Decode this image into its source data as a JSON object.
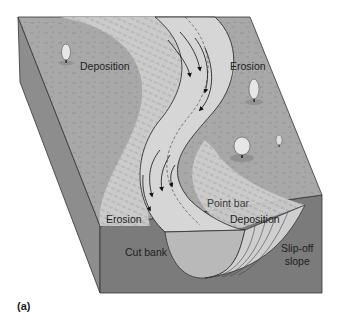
{
  "figure": {
    "caption": "(a)",
    "colors": {
      "floodplain": "#a9a9a9",
      "floodplain_dark": "#9a9a9a",
      "side_face": "#8a8a8a",
      "front_face": "#7a7a7a",
      "channel_water": "#d4d4d4",
      "point_bar": "#c8c8c8",
      "cross_section_water": "#b8b8b8",
      "outline": "#333333"
    }
  },
  "labels": {
    "deposition_upper_left": "Deposition",
    "erosion_upper_right": "Erosion",
    "point_bar": "Point bar",
    "erosion_lower_left": "Erosion",
    "deposition_lower_right": "Deposition",
    "cut_bank": "Cut bank",
    "slip_off_slope_line1": "Slip-off",
    "slip_off_slope_line2": "slope"
  },
  "icons": {
    "flow_arrows": "arrow-icon",
    "trees": "tree-icon"
  }
}
